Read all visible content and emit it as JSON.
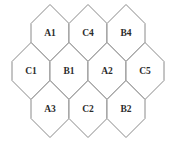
{
  "diagram": {
    "type": "hexagonal-grid",
    "title": "",
    "background_color": "#ffffff",
    "stroke_color": "#8a8a8a",
    "label_color": "#2b2b2b",
    "geometry": {
      "hex_width": 38,
      "hex_height": 57,
      "apex_offset": 19,
      "row_step": 38,
      "col_step": 38
    },
    "rows": [
      {
        "name": "top-row",
        "cells": [
          {
            "label": "A1",
            "cx": 50,
            "cy": 33,
            "clipped": false
          },
          {
            "label": "C4",
            "cx": 88,
            "cy": 33,
            "clipped": false
          },
          {
            "label": "B4",
            "cx": 126,
            "cy": 33,
            "clipped": false
          }
        ]
      },
      {
        "name": "middle-row",
        "cells": [
          {
            "label": "C1",
            "cx": 31,
            "cy": 71,
            "clipped": true
          },
          {
            "label": "B1",
            "cx": 69,
            "cy": 71,
            "clipped": false
          },
          {
            "label": "A2",
            "cx": 107,
            "cy": 71,
            "clipped": false
          },
          {
            "label": "C5",
            "cx": 145,
            "cy": 71,
            "clipped": true
          }
        ]
      },
      {
        "name": "bottom-row",
        "cells": [
          {
            "label": "A3",
            "cx": 50,
            "cy": 109,
            "clipped": false
          },
          {
            "label": "C2",
            "cx": 88,
            "cy": 109,
            "clipped": false
          },
          {
            "label": "B2",
            "cx": 126,
            "cy": 109,
            "clipped": false
          }
        ]
      }
    ]
  }
}
